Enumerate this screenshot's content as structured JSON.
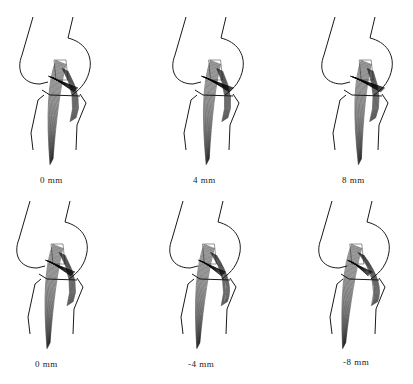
{
  "figure": {
    "panels": [
      {
        "id": "top-left",
        "caption": "0 mm",
        "row": 0,
        "col": 0,
        "left": 0,
        "top": 0,
        "caption_x": 40,
        "caption_y": 175,
        "shift": 0
      },
      {
        "id": "top-mid",
        "caption": "4 mm",
        "row": 0,
        "col": 1,
        "left": 140,
        "top": 0,
        "caption_x": 53,
        "caption_y": 175,
        "shift": 4
      },
      {
        "id": "top-right",
        "caption": "8 mm",
        "row": 0,
        "col": 2,
        "left": 273,
        "top": 0,
        "caption_x": 69,
        "caption_y": 175,
        "shift": 8
      },
      {
        "id": "bottom-left",
        "caption": "0 mm",
        "row": 1,
        "col": 0,
        "left": 0,
        "top": 190,
        "caption_x": 35,
        "caption_y": 169,
        "shift": 0
      },
      {
        "id": "bottom-mid",
        "caption": "-4 mm",
        "row": 1,
        "col": 1,
        "left": 140,
        "top": 190,
        "caption_x": 48,
        "caption_y": 169,
        "shift": -4
      },
      {
        "id": "bottom-right",
        "caption": "-8 mm",
        "row": 1,
        "col": 2,
        "left": 273,
        "top": 190,
        "caption_x": 70,
        "caption_y": 167,
        "shift": -8
      }
    ],
    "colors": {
      "background": "#ffffff",
      "line": "#1a1a1a",
      "text": "#222222"
    }
  }
}
